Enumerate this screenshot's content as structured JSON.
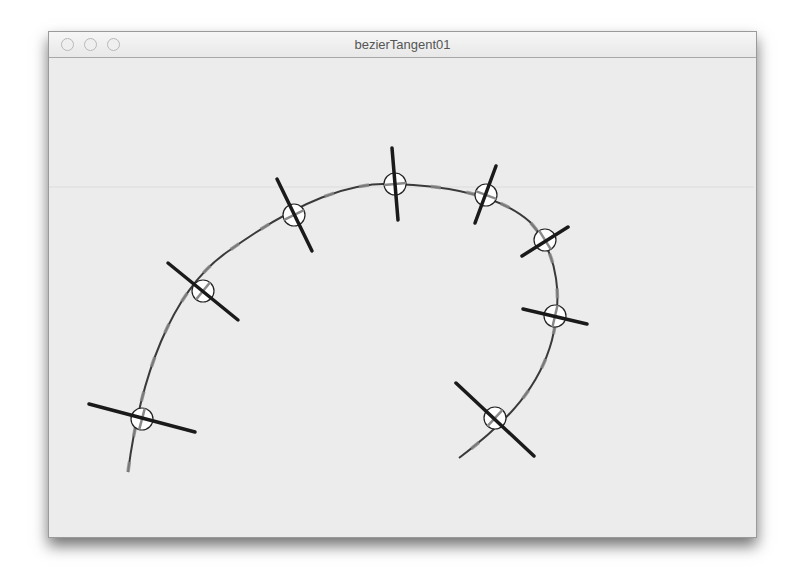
{
  "window": {
    "title": "bezierTangent01",
    "traffic_lights": [
      "close-button",
      "minimize-button",
      "zoom-button"
    ]
  },
  "sketch": {
    "background": "#ececec",
    "curve_color": "#3a3a3a",
    "tangent_color": "#8a8a8a",
    "normal_color": "#1a1a1a",
    "curve_path": "M128,472 C140,380 170,290 230,250 C300,200 350,182 395,184 C450,186 500,195 530,222 C560,255 562,300 552,340 C540,385 510,420 459,458",
    "samples": [
      {
        "x": 142,
        "y": 419,
        "nx1": 89,
        "ny1": 404,
        "nx2": 195,
        "ny2": 432
      },
      {
        "x": 203,
        "y": 291,
        "nx1": 168,
        "ny1": 263,
        "nx2": 238,
        "ny2": 320
      },
      {
        "x": 294,
        "y": 215,
        "nx1": 277,
        "ny1": 179,
        "nx2": 312,
        "ny2": 251
      },
      {
        "x": 395,
        "y": 184,
        "nx1": 392,
        "ny1": 148,
        "nx2": 398,
        "ny2": 220
      },
      {
        "x": 486,
        "y": 195,
        "nx1": 496,
        "ny1": 166,
        "nx2": 475,
        "ny2": 223
      },
      {
        "x": 545,
        "y": 240,
        "nx1": 568,
        "ny1": 227,
        "nx2": 522,
        "ny2": 256
      },
      {
        "x": 555,
        "y": 316,
        "nx1": 523,
        "ny1": 309,
        "nx2": 587,
        "ny2": 324
      },
      {
        "x": 495,
        "y": 418,
        "nx1": 456,
        "ny1": 383,
        "nx2": 534,
        "ny2": 456
      }
    ]
  }
}
